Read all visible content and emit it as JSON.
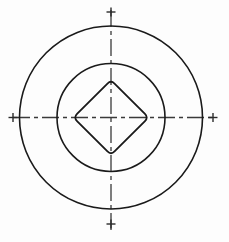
{
  "drawing": {
    "title": "Concentric circles with inscribed diamond",
    "canvas": {
      "width": 229,
      "height": 242,
      "background_color": "#fdfdfd"
    },
    "center": {
      "x": 111,
      "y": 117.5
    },
    "line_color": "#1a1a1a",
    "centerline_color": "#3a3a3a",
    "shapes": {
      "outer_circle": {
        "name": "outer-circle",
        "cx": 111,
        "cy": 117.5,
        "r": 91.5,
        "stroke_width": 1.6
      },
      "inner_circle": {
        "name": "inner-circle",
        "cx": 111,
        "cy": 117.5,
        "r": 54,
        "stroke_width": 1.6
      },
      "diamond": {
        "name": "inscribed-diamond",
        "half_diagonal": 37.5,
        "corner_radius": 5,
        "stroke_width": 1.8,
        "vertices": [
          {
            "x": 111,
            "y": 80
          },
          {
            "x": 148.5,
            "y": 117.5
          },
          {
            "x": 111,
            "y": 155
          },
          {
            "x": 73.5,
            "y": 117.5
          }
        ]
      }
    },
    "centerlines": {
      "horizontal": {
        "name": "horizontal-centerline",
        "x1": 13,
        "x2": 213,
        "y": 117.5,
        "stroke_width": 1.3,
        "dash_pattern": "17 4 4 4"
      },
      "vertical": {
        "name": "vertical-centerline",
        "y1": 10,
        "y2": 232,
        "x": 111,
        "stroke_width": 1.3,
        "dash_pattern": "17 4 4 4"
      }
    },
    "tick_marks": {
      "stroke_width": 1.4,
      "arm_length": 9,
      "items": [
        {
          "name": "tick-left",
          "cx": 13,
          "cy": 117.5
        },
        {
          "name": "tick-right",
          "cx": 213,
          "cy": 117.5
        },
        {
          "name": "tick-top",
          "cx": 111,
          "cy": 12
        },
        {
          "name": "tick-bottom",
          "cx": 111,
          "cy": 224
        }
      ]
    }
  }
}
